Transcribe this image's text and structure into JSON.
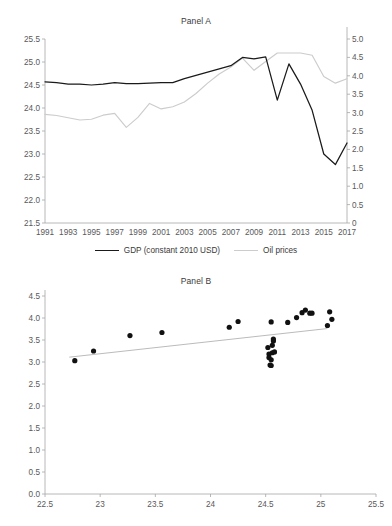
{
  "figure": {
    "panel_a_title": "Panel A",
    "panel_b_title": "Panel B"
  },
  "legend": {
    "items": [
      {
        "label": "GDP (constant 2010 USD)",
        "color": "#1a1a1a",
        "icon": "line-swatch-black"
      },
      {
        "label": "Oil prices",
        "color": "#cccccc",
        "icon": "line-swatch-gray"
      }
    ]
  },
  "chart_data": [
    {
      "type": "line",
      "title": "Panel A",
      "xlabel": "",
      "ylabel": "",
      "grid": false,
      "legend_position": "bottom",
      "x": [
        1991,
        1992,
        1993,
        1994,
        1995,
        1996,
        1997,
        1998,
        1999,
        2000,
        2001,
        2002,
        2003,
        2004,
        2005,
        2006,
        2007,
        2008,
        2009,
        2010,
        2011,
        2012,
        2013,
        2014,
        2015,
        2016,
        2017
      ],
      "xtick_labels": [
        "1991",
        "1993",
        "1995",
        "1997",
        "1999",
        "2001",
        "2003",
        "2005",
        "2007",
        "2009",
        "2011",
        "2013",
        "2015",
        "2017"
      ],
      "xlim": [
        1991,
        2017
      ],
      "series": [
        {
          "name": "GDP (constant 2010 USD)",
          "axis": "left",
          "color": "#1a1a1a",
          "ylabel": "",
          "ylim": [
            21.5,
            25.5
          ],
          "yticks": [
            21.5,
            22.0,
            22.5,
            23.0,
            23.5,
            24.0,
            24.5,
            25.0,
            25.5
          ],
          "values": [
            24.57,
            24.55,
            24.52,
            24.52,
            24.5,
            24.52,
            24.55,
            24.53,
            24.53,
            24.54,
            24.55,
            24.55,
            24.64,
            24.71,
            24.78,
            24.85,
            24.92,
            25.1,
            25.07,
            25.11,
            24.17,
            24.96,
            24.52,
            23.95,
            23.0,
            22.77,
            23.24
          ]
        },
        {
          "name": "Oil prices",
          "axis": "right",
          "color": "#cccccc",
          "ylabel": "",
          "ylim": [
            0,
            5.0
          ],
          "yticks": [
            0,
            0.5,
            1.0,
            1.5,
            2.0,
            2.5,
            3.0,
            3.5,
            4.0,
            4.5,
            5.0
          ],
          "values": [
            2.95,
            2.92,
            2.86,
            2.8,
            2.82,
            2.93,
            2.98,
            2.6,
            2.87,
            3.25,
            3.1,
            3.16,
            3.29,
            3.52,
            3.8,
            4.05,
            4.24,
            4.48,
            4.15,
            4.39,
            4.62,
            4.62,
            4.62,
            4.56,
            3.98,
            3.8,
            3.92
          ]
        }
      ]
    },
    {
      "type": "scatter",
      "title": "Panel B",
      "xlabel": "",
      "ylabel": "",
      "grid": false,
      "xlim": [
        22.5,
        25.5
      ],
      "ylim": [
        0.0,
        4.5
      ],
      "xticks": [
        22.5,
        23,
        23.5,
        24,
        24.5,
        25,
        25.5
      ],
      "xtick_labels": [
        "22.5",
        "23",
        "23.5",
        "24",
        "24.5",
        "25",
        "25.5"
      ],
      "yticks": [
        0.0,
        0.5,
        1.0,
        1.5,
        2.0,
        2.5,
        3.0,
        3.5,
        4.0,
        4.5
      ],
      "ytick_labels": [
        "0.0",
        "0.5",
        "1.0",
        "1.5",
        "2.0",
        "2.5",
        "3.0",
        "3.5",
        "4.0",
        "4.5"
      ],
      "points": [
        [
          22.77,
          3.03
        ],
        [
          22.94,
          3.25
        ],
        [
          23.27,
          3.6
        ],
        [
          23.56,
          3.67
        ],
        [
          24.17,
          3.79
        ],
        [
          24.25,
          3.92
        ],
        [
          24.52,
          3.33
        ],
        [
          24.53,
          3.18
        ],
        [
          24.53,
          3.1
        ],
        [
          24.54,
          2.93
        ],
        [
          24.55,
          2.92
        ],
        [
          24.55,
          3.05
        ],
        [
          24.56,
          3.21
        ],
        [
          24.56,
          3.38
        ],
        [
          24.57,
          3.48
        ],
        [
          24.57,
          3.52
        ],
        [
          24.58,
          3.23
        ],
        [
          24.55,
          3.91
        ],
        [
          24.7,
          3.9
        ],
        [
          24.78,
          4.01
        ],
        [
          24.83,
          4.12
        ],
        [
          24.86,
          4.18
        ],
        [
          24.9,
          4.11
        ],
        [
          24.92,
          4.11
        ],
        [
          25.06,
          3.83
        ],
        [
          25.08,
          4.14
        ],
        [
          25.1,
          3.97
        ]
      ],
      "trendline": {
        "x0": 22.72,
        "y0": 3.11,
        "x1": 25.06,
        "y1": 3.76,
        "color": "#9d9d9d"
      }
    }
  ]
}
